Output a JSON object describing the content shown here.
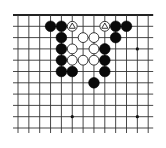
{
  "diagram": {
    "type": "go-board-fragment",
    "background": "#ffffff",
    "line_color": "#333333",
    "edge_line_color": "#222222",
    "grid": {
      "columns": 13,
      "rows": 11,
      "origin_x": 18,
      "origin_y": 15,
      "spacing_x": 10.85,
      "spacing_y": 11.3,
      "top_edge": true,
      "left_edge": false,
      "right_edge": false,
      "bottom_edge": false
    },
    "star_points": [
      {
        "col": 5,
        "row": 9
      },
      {
        "col": 11,
        "row": 3
      },
      {
        "col": 11,
        "row": 9
      }
    ],
    "stones": [
      {
        "color": "black",
        "col": 3,
        "row": 1
      },
      {
        "color": "black",
        "col": 4,
        "row": 1
      },
      {
        "color": "white",
        "col": 5,
        "row": 1,
        "mark": "triangle"
      },
      {
        "color": "white",
        "col": 8,
        "row": 1,
        "mark": "triangle"
      },
      {
        "color": "black",
        "col": 9,
        "row": 1
      },
      {
        "color": "black",
        "col": 10,
        "row": 1
      },
      {
        "color": "black",
        "col": 4,
        "row": 2
      },
      {
        "color": "white",
        "col": 6,
        "row": 2
      },
      {
        "color": "white",
        "col": 7,
        "row": 2
      },
      {
        "color": "black",
        "col": 9,
        "row": 2
      },
      {
        "color": "black",
        "col": 4,
        "row": 3
      },
      {
        "color": "white",
        "col": 5,
        "row": 3
      },
      {
        "color": "white",
        "col": 7,
        "row": 3
      },
      {
        "color": "black",
        "col": 8,
        "row": 3
      },
      {
        "color": "black",
        "col": 4,
        "row": 4
      },
      {
        "color": "white",
        "col": 5,
        "row": 4
      },
      {
        "color": "white",
        "col": 6,
        "row": 4
      },
      {
        "color": "white",
        "col": 7,
        "row": 4
      },
      {
        "color": "black",
        "col": 8,
        "row": 4
      },
      {
        "color": "black",
        "col": 4,
        "row": 5
      },
      {
        "color": "black",
        "col": 5,
        "row": 5
      },
      {
        "color": "black",
        "col": 8,
        "row": 5
      },
      {
        "color": "black",
        "col": 7,
        "row": 6
      }
    ]
  }
}
